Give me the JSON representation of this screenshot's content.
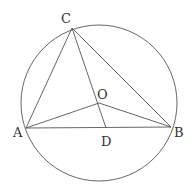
{
  "diagram": {
    "type": "geometry",
    "colors": {
      "stroke": "#555555",
      "label": "#333333",
      "background": "#ffffff"
    },
    "circle": {
      "center": "O",
      "cx": 99,
      "cy": 103,
      "r": 78
    },
    "points": [
      {
        "id": "A",
        "label": "A",
        "x": 26,
        "y": 128,
        "lx": 13,
        "ly": 137
      },
      {
        "id": "B",
        "label": "B",
        "x": 171,
        "y": 127,
        "lx": 174,
        "ly": 137
      },
      {
        "id": "C",
        "label": "C",
        "x": 72,
        "y": 28,
        "lx": 61,
        "ly": 23
      },
      {
        "id": "O",
        "label": "O",
        "x": 99,
        "y": 103,
        "lx": 97,
        "ly": 99
      },
      {
        "id": "D",
        "label": "D",
        "x": 106,
        "y": 128,
        "lx": 101,
        "ly": 146
      }
    ],
    "segments": [
      [
        "A",
        "B"
      ],
      [
        "B",
        "C"
      ],
      [
        "C",
        "A"
      ],
      [
        "O",
        "A"
      ],
      [
        "O",
        "B"
      ],
      [
        "C",
        "D"
      ]
    ]
  }
}
